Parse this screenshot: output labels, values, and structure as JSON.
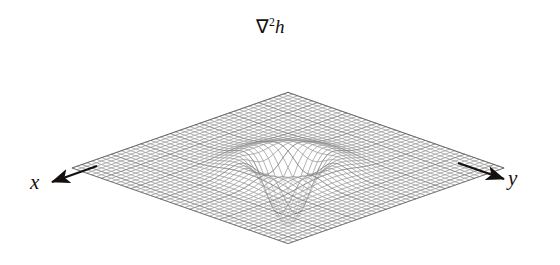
{
  "figure": {
    "background_color": "#ffffff",
    "ink_color": "#14100e",
    "mesh_color": "#8d8d8d",
    "mesh_dark_color": "#565656"
  },
  "labels": {
    "z_nabla": "∇",
    "z_exponent": "2",
    "z_function": "h",
    "z_full": "∇2h",
    "x_axis": "x",
    "y_axis": "y"
  },
  "chart_data": {
    "type": "line",
    "render": "wireframe-surface-3d",
    "title": "∇2h",
    "subtitle": "",
    "xlabel": "x",
    "ylabel": "y",
    "zlabel": "∇2h",
    "grid": false,
    "legend": null,
    "function": "Laplacian of Gaussian (Mexican hat / Marr-Hildreth operator)",
    "formula": "∇2h(x,y) = ((x^2 + y^2 - 2σ^2)/σ^4) * exp(-(x^2+y^2)/(2σ^2))",
    "sigma": 1.0,
    "xlim": [
      -6,
      6
    ],
    "ylim": [
      -6,
      6
    ],
    "zlim": [
      -0.45,
      2.0
    ],
    "grid_n": 44,
    "projection": {
      "elevation_deg": 18,
      "azimuth_deg": 45,
      "center_x": 288,
      "center_y": 168,
      "scale_x": 36.0,
      "scale_y": 12.6,
      "scale_z": 58.0
    },
    "features": [
      {
        "name": "central positive peak",
        "radial_position": 0.0,
        "value": 2.0
      },
      {
        "name": "zero crossing ring",
        "radial_position": 1.414,
        "value": 0.0
      },
      {
        "name": "negative trough ring",
        "radial_position": 2.45,
        "value": -0.45
      },
      {
        "name": "flat outer plane",
        "radial_position": 6.0,
        "value": 0.0
      }
    ],
    "radial_profile": {
      "r": [
        0.0,
        0.25,
        0.5,
        0.75,
        1.0,
        1.25,
        1.414,
        1.6,
        1.8,
        2.0,
        2.2,
        2.45,
        2.7,
        3.0,
        3.4,
        3.8,
        4.3,
        5.0,
        6.0
      ],
      "value": [
        2.0,
        1.82,
        1.36,
        0.74,
        0.61,
        0.2,
        0.0,
        -0.17,
        -0.31,
        -0.4,
        -0.44,
        -0.45,
        -0.43,
        -0.33,
        -0.2,
        -0.1,
        -0.04,
        -0.01,
        0.0
      ]
    }
  },
  "annotations": {
    "x_arrow": {
      "from_x": 97,
      "from_y": 166,
      "to_x": 52,
      "to_y": 182,
      "direction": "left-down"
    },
    "y_arrow": {
      "from_x": 458,
      "from_y": 163,
      "to_x": 504,
      "to_y": 179,
      "direction": "right-down"
    }
  }
}
